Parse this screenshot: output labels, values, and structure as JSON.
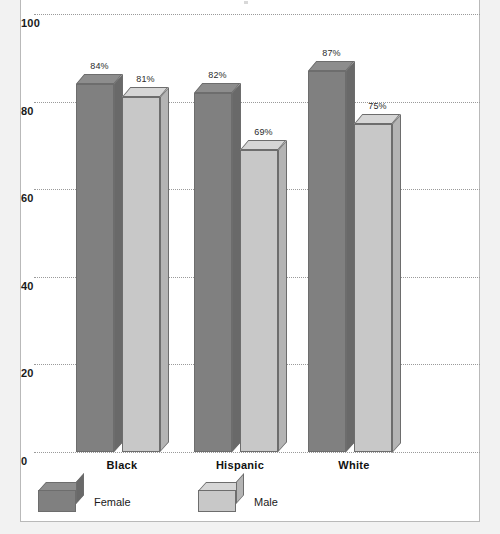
{
  "chart_data": {
    "type": "bar",
    "title": "",
    "subtitle": "",
    "xlabel": "",
    "ylabel": "",
    "categories": [
      "Black",
      "Hispanic",
      "White"
    ],
    "series": [
      {
        "name": "Female",
        "values": [
          84,
          82,
          87
        ],
        "color": "#808080"
      },
      {
        "name": "Male",
        "values": [
          81,
          69,
          75
        ],
        "color": "#c8c8c8"
      }
    ],
    "data_labels": [
      [
        "84%",
        "81%"
      ],
      [
        "82%",
        "69%"
      ],
      [
        "87%",
        "75%"
      ]
    ],
    "ylim": [
      0,
      100
    ],
    "yticks": [
      0,
      20,
      40,
      60,
      80,
      100
    ],
    "ytick_labels": [
      "0",
      "20",
      "40",
      "60",
      "80",
      "100"
    ],
    "grid": true,
    "grid_style": "dotted",
    "legend_position": "bottom-left",
    "style": "3d-clustered-column"
  },
  "axis": {
    "y": {
      "ticks": [
        {
          "label": "100",
          "value": 100
        },
        {
          "label": "80",
          "value": 80
        },
        {
          "label": "60",
          "value": 60
        },
        {
          "label": "40",
          "value": 40
        },
        {
          "label": "20",
          "value": 20
        },
        {
          "label": "0",
          "value": 0
        }
      ]
    },
    "x": {
      "categories": [
        {
          "label": "Black"
        },
        {
          "label": "Hispanic"
        },
        {
          "label": "White"
        }
      ]
    }
  },
  "bars": [
    {
      "group": "Black",
      "series": "Female",
      "value": 84,
      "label": "84%",
      "color": "#808080"
    },
    {
      "group": "Black",
      "series": "Male",
      "value": 81,
      "label": "81%",
      "color": "#c8c8c8"
    },
    {
      "group": "Hispanic",
      "series": "Female",
      "value": 82,
      "label": "82%",
      "color": "#808080"
    },
    {
      "group": "Hispanic",
      "series": "Male",
      "value": 69,
      "label": "69%",
      "color": "#c8c8c8"
    },
    {
      "group": "White",
      "series": "Female",
      "value": 87,
      "label": "87%",
      "color": "#808080"
    },
    {
      "group": "White",
      "series": "Male",
      "value": 75,
      "label": "75%",
      "color": "#c8c8c8"
    }
  ],
  "legend": {
    "items": [
      {
        "label": "Female",
        "color": "#808080"
      },
      {
        "label": "Male",
        "color": "#c8c8c8"
      }
    ]
  },
  "colors": {
    "female": "#808080",
    "male": "#c8c8c8",
    "gridline": "#9a9a9a",
    "text": "#1a1a1a",
    "background": "#ffffff",
    "page": "#f2f2f2",
    "frame": "#b9b9b9"
  }
}
